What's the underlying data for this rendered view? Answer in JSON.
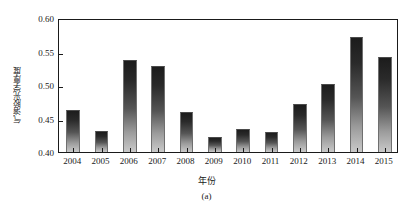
{
  "chart_data": {
    "type": "bar",
    "title": "",
    "subtitle": "",
    "xlabel": "年份",
    "ylabel": "气溶胶光学厚度",
    "caption": "(a)",
    "categories": [
      "2004",
      "2005",
      "2006",
      "2007",
      "2008",
      "2009",
      "2010",
      "2011",
      "2012",
      "2013",
      "2014",
      "2015"
    ],
    "values": [
      0.462,
      0.432,
      0.538,
      0.529,
      0.459,
      0.423,
      0.434,
      0.43,
      0.472,
      0.502,
      0.571,
      0.542
    ],
    "ylim": [
      0.4,
      0.6
    ],
    "ytick_labels": [
      "0.40",
      "0.45",
      "0.50",
      "0.55",
      "0.60"
    ],
    "ytick_values": [
      0.4,
      0.45,
      0.5,
      0.55,
      0.6
    ],
    "grid": false,
    "legend": null,
    "bar_gradient_top_color": "#1c1c1c",
    "bar_gradient_bottom_color": "#c9c9c9",
    "axis_color": "#1a1a1a",
    "background_color": "#ffffff"
  }
}
